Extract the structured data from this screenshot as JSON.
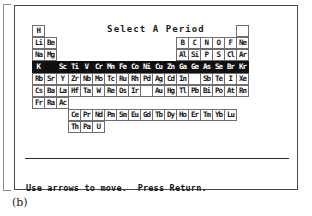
{
  "window": {
    "title": "Select A Period"
  },
  "caption": "(b)",
  "footer": {
    "line1": "Use arrows to move.  Press Return.",
    "line2": "Escape: Property Search"
  },
  "periodic_table": {
    "selected_period_index": 3,
    "cursor_symbol": "K",
    "rows": [
      {
        "label": "period-1",
        "highlighted": false,
        "cells": [
          {
            "symbol": "H",
            "state": "normal"
          },
          {
            "symbol": "",
            "state": "gap"
          },
          {
            "symbol": "",
            "state": "gap"
          },
          {
            "symbol": "",
            "state": "gap"
          },
          {
            "symbol": "",
            "state": "gap"
          },
          {
            "symbol": "",
            "state": "gap"
          },
          {
            "symbol": "",
            "state": "gap"
          },
          {
            "symbol": "",
            "state": "gap"
          },
          {
            "symbol": "",
            "state": "gap"
          },
          {
            "symbol": "",
            "state": "gap"
          },
          {
            "symbol": "",
            "state": "gap"
          },
          {
            "symbol": "",
            "state": "gap"
          },
          {
            "symbol": "",
            "state": "gap"
          },
          {
            "symbol": "",
            "state": "gap"
          },
          {
            "symbol": "",
            "state": "gap"
          },
          {
            "symbol": "",
            "state": "gap"
          },
          {
            "symbol": "",
            "state": "gap"
          },
          {
            "symbol": "",
            "state": "blank"
          }
        ]
      },
      {
        "label": "period-2",
        "highlighted": false,
        "cells": [
          {
            "symbol": "Li",
            "state": "normal"
          },
          {
            "symbol": "Be",
            "state": "normal"
          },
          {
            "symbol": "",
            "state": "gap"
          },
          {
            "symbol": "",
            "state": "gap"
          },
          {
            "symbol": "",
            "state": "gap"
          },
          {
            "symbol": "",
            "state": "gap"
          },
          {
            "symbol": "",
            "state": "gap"
          },
          {
            "symbol": "",
            "state": "gap"
          },
          {
            "symbol": "",
            "state": "gap"
          },
          {
            "symbol": "",
            "state": "gap"
          },
          {
            "symbol": "",
            "state": "gap"
          },
          {
            "symbol": "",
            "state": "gap"
          },
          {
            "symbol": "B",
            "state": "normal"
          },
          {
            "symbol": "C",
            "state": "normal"
          },
          {
            "symbol": "N",
            "state": "normal"
          },
          {
            "symbol": "O",
            "state": "normal"
          },
          {
            "symbol": "F",
            "state": "normal"
          },
          {
            "symbol": "Ne",
            "state": "normal"
          }
        ]
      },
      {
        "label": "period-3",
        "highlighted": false,
        "cells": [
          {
            "symbol": "Na",
            "state": "normal"
          },
          {
            "symbol": "Mg",
            "state": "normal"
          },
          {
            "symbol": "",
            "state": "gap"
          },
          {
            "symbol": "",
            "state": "gap"
          },
          {
            "symbol": "",
            "state": "gap"
          },
          {
            "symbol": "",
            "state": "gap"
          },
          {
            "symbol": "",
            "state": "gap"
          },
          {
            "symbol": "",
            "state": "gap"
          },
          {
            "symbol": "",
            "state": "gap"
          },
          {
            "symbol": "",
            "state": "gap"
          },
          {
            "symbol": "",
            "state": "gap"
          },
          {
            "symbol": "",
            "state": "gap"
          },
          {
            "symbol": "Al",
            "state": "normal"
          },
          {
            "symbol": "Si",
            "state": "normal"
          },
          {
            "symbol": "P",
            "state": "normal"
          },
          {
            "symbol": "S",
            "state": "normal"
          },
          {
            "symbol": "Cl",
            "state": "normal"
          },
          {
            "symbol": "Ar",
            "state": "normal"
          }
        ]
      },
      {
        "label": "period-4",
        "highlighted": true,
        "cells": [
          {
            "symbol": "K",
            "state": "cursor"
          },
          {
            "symbol": "Ca",
            "state": "invblank"
          },
          {
            "symbol": "Sc",
            "state": "inverted"
          },
          {
            "symbol": "Ti",
            "state": "inverted"
          },
          {
            "symbol": "V",
            "state": "inverted"
          },
          {
            "symbol": "Cr",
            "state": "inverted"
          },
          {
            "symbol": "Mn",
            "state": "inverted"
          },
          {
            "symbol": "Fe",
            "state": "inverted"
          },
          {
            "symbol": "Co",
            "state": "inverted"
          },
          {
            "symbol": "Ni",
            "state": "inverted"
          },
          {
            "symbol": "Cu",
            "state": "inverted"
          },
          {
            "symbol": "Zn",
            "state": "inverted"
          },
          {
            "symbol": "Ga",
            "state": "inverted"
          },
          {
            "symbol": "Ge",
            "state": "inverted"
          },
          {
            "symbol": "As",
            "state": "inverted"
          },
          {
            "symbol": "Se",
            "state": "inverted"
          },
          {
            "symbol": "Br",
            "state": "inverted"
          },
          {
            "symbol": "Kr",
            "state": "inverted"
          }
        ]
      },
      {
        "label": "period-5",
        "highlighted": false,
        "cells": [
          {
            "symbol": "Rb",
            "state": "normal"
          },
          {
            "symbol": "Sr",
            "state": "normal"
          },
          {
            "symbol": "Y",
            "state": "normal"
          },
          {
            "symbol": "Zr",
            "state": "normal"
          },
          {
            "symbol": "Nb",
            "state": "normal"
          },
          {
            "symbol": "Mo",
            "state": "normal"
          },
          {
            "symbol": "Tc",
            "state": "normal"
          },
          {
            "symbol": "Ru",
            "state": "normal"
          },
          {
            "symbol": "Rh",
            "state": "normal"
          },
          {
            "symbol": "Pd",
            "state": "normal"
          },
          {
            "symbol": "Ag",
            "state": "normal"
          },
          {
            "symbol": "Cd",
            "state": "normal"
          },
          {
            "symbol": "In",
            "state": "normal"
          },
          {
            "symbol": "",
            "state": "blank"
          },
          {
            "symbol": "Sb",
            "state": "normal"
          },
          {
            "symbol": "Te",
            "state": "normal"
          },
          {
            "symbol": "I",
            "state": "normal"
          },
          {
            "symbol": "Xe",
            "state": "normal"
          }
        ]
      },
      {
        "label": "period-6",
        "highlighted": false,
        "cells": [
          {
            "symbol": "Cs",
            "state": "normal"
          },
          {
            "symbol": "Ba",
            "state": "normal"
          },
          {
            "symbol": "La",
            "state": "normal"
          },
          {
            "symbol": "Hf",
            "state": "normal"
          },
          {
            "symbol": "Ta",
            "state": "normal"
          },
          {
            "symbol": "W",
            "state": "normal"
          },
          {
            "symbol": "Re",
            "state": "normal"
          },
          {
            "symbol": "Os",
            "state": "normal"
          },
          {
            "symbol": "Ir",
            "state": "normal"
          },
          {
            "symbol": "",
            "state": "blank"
          },
          {
            "symbol": "Au",
            "state": "normal"
          },
          {
            "symbol": "Hg",
            "state": "normal"
          },
          {
            "symbol": "Tl",
            "state": "normal"
          },
          {
            "symbol": "Pb",
            "state": "normal"
          },
          {
            "symbol": "Bi",
            "state": "normal"
          },
          {
            "symbol": "Po",
            "state": "normal"
          },
          {
            "symbol": "At",
            "state": "normal"
          },
          {
            "symbol": "Rn",
            "state": "normal"
          }
        ]
      },
      {
        "label": "period-7",
        "highlighted": false,
        "cells": [
          {
            "symbol": "Fr",
            "state": "normal"
          },
          {
            "symbol": "Ra",
            "state": "normal"
          },
          {
            "symbol": "Ac",
            "state": "normal"
          }
        ]
      },
      {
        "label": "lanthanides",
        "highlighted": false,
        "indent": 3,
        "cells": [
          {
            "symbol": "Ce",
            "state": "normal"
          },
          {
            "symbol": "Pr",
            "state": "normal"
          },
          {
            "symbol": "Nd",
            "state": "normal"
          },
          {
            "symbol": "Pm",
            "state": "normal"
          },
          {
            "symbol": "Sm",
            "state": "normal"
          },
          {
            "symbol": "Eu",
            "state": "normal"
          },
          {
            "symbol": "Gd",
            "state": "normal"
          },
          {
            "symbol": "Tb",
            "state": "normal"
          },
          {
            "symbol": "Dy",
            "state": "normal"
          },
          {
            "symbol": "Ho",
            "state": "normal"
          },
          {
            "symbol": "Er",
            "state": "normal"
          },
          {
            "symbol": "Tm",
            "state": "normal"
          },
          {
            "symbol": "Yb",
            "state": "normal"
          },
          {
            "symbol": "Lu",
            "state": "normal"
          }
        ]
      },
      {
        "label": "actinides",
        "highlighted": false,
        "indent": 3,
        "cells": [
          {
            "symbol": "Th",
            "state": "normal"
          },
          {
            "symbol": "Pa",
            "state": "normal"
          },
          {
            "symbol": "U",
            "state": "normal"
          }
        ]
      }
    ]
  }
}
